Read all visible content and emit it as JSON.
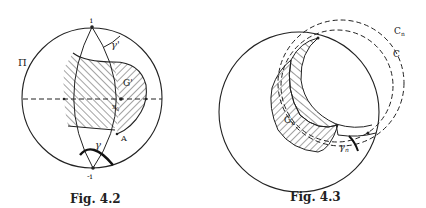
{
  "figures": [
    {
      "id": "fig-4-2",
      "caption": "Fig. 4.2",
      "labels": {
        "top_point": "i",
        "bottom_point": "-i",
        "plane": "Π",
        "gamma_prime": "γ'",
        "region": "G'",
        "center_point": "x",
        "center_point_sub": "0",
        "point_a": "A",
        "gamma": "γ"
      }
    },
    {
      "id": "fig-4-3",
      "caption": "Fig. 4.3",
      "labels": {
        "circle_cn": "C",
        "circle_cn_sub": "n",
        "circle_c": "C",
        "region_gn": "G",
        "region_gn_sub": "n",
        "gamma_n": "γ",
        "gamma_n_sub": "n"
      }
    }
  ],
  "colors": {
    "ink": "#222222",
    "background": "#ffffff"
  }
}
